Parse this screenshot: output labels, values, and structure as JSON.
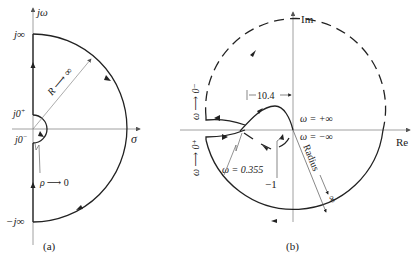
{
  "diagram_a": {
    "caption": "(a)",
    "axis_imag_label": "jω",
    "axis_real_label": "σ",
    "label_j_inf": "j∞",
    "label_neg_j_inf": "−j∞",
    "label_j0_plus": "j0",
    "label_j0_plus_sup": "+",
    "label_j0_minus": "j0",
    "label_j0_minus_sup": "−",
    "radius_label": "R ⟶ ∞",
    "rho_label_sym": "ρ",
    "rho_label_rest": "⟶ 0"
  },
  "diagram_b": {
    "caption": "(b)",
    "axis_imag_label": "Im",
    "axis_real_label": "Re",
    "dimension_label": "10.4",
    "omega_plus_inf": "ω = +∞",
    "omega_minus_inf": "ω = −∞",
    "omega_crossing": "ω = 0.355",
    "critical_point": "−1",
    "radius_label": "Radius",
    "radius_inf": "∞",
    "omega_to_0_minus": "ω ⟶ 0⁻",
    "omega_to_0_plus": "ω ⟶ 0⁺"
  },
  "colors": {
    "line": "#222222",
    "axis": "#888888",
    "background": "#ffffff"
  }
}
